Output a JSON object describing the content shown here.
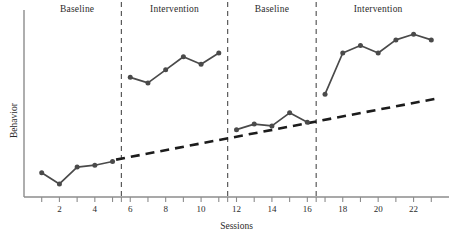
{
  "chart_data": {
    "type": "line",
    "title": "",
    "xlabel": "Sessions",
    "ylabel": "Behavior",
    "xlim": [
      0,
      24
    ],
    "ylim": [
      0,
      100
    ],
    "grid": false,
    "legend": "none",
    "x_tick_labels": [
      "2",
      "4",
      "6",
      "8",
      "10",
      "12",
      "14",
      "16",
      "18",
      "20",
      "22"
    ],
    "x_tick_values": [
      2,
      4,
      6,
      8,
      10,
      12,
      14,
      16,
      18,
      20,
      22
    ],
    "x_minor_ticks": [
      1,
      3,
      5,
      5.5,
      7,
      9,
      11,
      11.5,
      13,
      15,
      16.5,
      17,
      19,
      21,
      23
    ],
    "y_tick_labels": [],
    "phases": [
      {
        "label": "Baseline",
        "start": 1,
        "end": 5,
        "center": 3
      },
      {
        "label": "Intervention",
        "start": 6,
        "end": 11,
        "center": 8.5
      },
      {
        "label": "Baseline",
        "start": 12,
        "end": 16,
        "center": 14
      },
      {
        "label": "Intervention",
        "start": 17,
        "end": 23,
        "center": 20
      }
    ],
    "phase_dividers": [
      5.5,
      11.5,
      16.5
    ],
    "series": [
      {
        "name": "Baseline 1",
        "style": "solid-marker",
        "x": [
          1,
          2,
          3,
          4,
          5
        ],
        "values": [
          13,
          7,
          16,
          17,
          19
        ]
      },
      {
        "name": "Intervention 1",
        "style": "solid-marker",
        "x": [
          6,
          7,
          8,
          9,
          10,
          11
        ],
        "values": [
          64,
          61,
          68,
          75,
          71,
          77
        ]
      },
      {
        "name": "Baseline 2",
        "style": "solid-marker",
        "x": [
          12,
          13,
          14,
          15,
          16
        ],
        "values": [
          36,
          39,
          38,
          45,
          40
        ]
      },
      {
        "name": "Intervention 2",
        "style": "solid-marker",
        "x": [
          17,
          18,
          19,
          20,
          21,
          22,
          23
        ],
        "values": [
          55,
          77,
          81,
          77,
          84,
          87,
          84
        ]
      },
      {
        "name": "Trend line",
        "style": "dashed",
        "x": [
          5.2,
          23.5
        ],
        "values": [
          20,
          53
        ]
      }
    ],
    "colors": {
      "line": "#4a4a4a",
      "marker": "#4a4a4a",
      "axis": "#8c8c8c",
      "divider": "#5a5a5a",
      "trend": "#1c1c1c",
      "text": "#2b2b2b"
    }
  }
}
